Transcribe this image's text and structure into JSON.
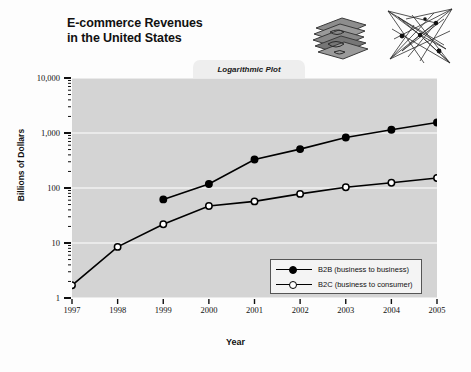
{
  "title": "E-commerce Revenues\nin the United States",
  "plot_tab_label": "Logarithmic Plot",
  "artwork": {
    "money_icon": "stack-of-money-icon",
    "network_icon": "network-graph-icon"
  },
  "axes": {
    "y_title": "Billions of Dollars",
    "x_title": "Year",
    "y_ticks": [
      "10,000",
      "1,000",
      "100",
      "10",
      "1"
    ],
    "x_ticks": [
      "1997",
      "1998",
      "1999",
      "2000",
      "2001",
      "2002",
      "2003",
      "2004",
      "2005"
    ]
  },
  "legend": {
    "items": [
      {
        "label": "B2B (business to business)",
        "marker": "filled-circle"
      },
      {
        "label": "B2C (business to consumer)",
        "marker": "open-circle"
      }
    ]
  },
  "colors": {
    "plot_background": "#d4d4d4",
    "page_background": "#fdfdfd",
    "line": "#000000",
    "gridline": "#f2f2f2",
    "tab_background": "#eeeeee",
    "legend_background": "#f4f4f4"
  },
  "chart_data": {
    "type": "line",
    "title": "E-commerce Revenues in the United States",
    "subtitle": "Logarithmic Plot",
    "xlabel": "Year",
    "ylabel": "Billions of Dollars",
    "yscale": "log",
    "ylim": [
      1,
      10000
    ],
    "grid": true,
    "legend_position": "bottom-right",
    "x": [
      1997,
      1998,
      1999,
      2000,
      2001,
      2002,
      2003,
      2004,
      2005
    ],
    "series": [
      {
        "name": "B2B (business to business)",
        "marker": "filled-circle",
        "values": [
          null,
          null,
          62,
          118,
          330,
          510,
          830,
          1150,
          1550
        ]
      },
      {
        "name": "B2C (business to consumer)",
        "marker": "open-circle",
        "values": [
          1.7,
          8.5,
          22,
          47,
          57,
          78,
          103,
          125,
          152
        ]
      }
    ]
  }
}
